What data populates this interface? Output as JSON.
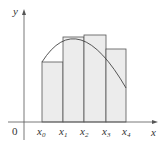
{
  "diagram": {
    "type": "riemann-sum-rectangles",
    "axes": {
      "x_label": "x",
      "y_label": "y",
      "origin_label": "0"
    },
    "partition_labels": [
      "x0",
      "x1",
      "x2",
      "x3",
      "x4"
    ],
    "partition_subscripts": [
      "0",
      "1",
      "2",
      "3",
      "4"
    ],
    "rectangles": [
      {
        "from": "x0",
        "to": "x1",
        "height_px": 60
      },
      {
        "from": "x1",
        "to": "x2",
        "height_px": 85
      },
      {
        "from": "x2",
        "to": "x3",
        "height_px": 87
      },
      {
        "from": "x3",
        "to": "x4",
        "height_px": 73
      }
    ],
    "colors": {
      "rect_fill": "#ececec",
      "line": "#444444",
      "axis": "#555555"
    }
  }
}
